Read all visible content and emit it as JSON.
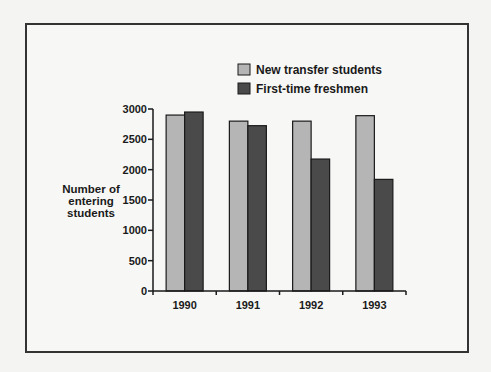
{
  "chart_data": {
    "type": "bar",
    "title": "",
    "categories": [
      "1990",
      "1991",
      "1992",
      "1993"
    ],
    "series": [
      {
        "name": "New transfer students",
        "values": [
          2900,
          2800,
          2800,
          2890
        ],
        "color": "#b5b5b5"
      },
      {
        "name": "First-time freshmen",
        "values": [
          2950,
          2725,
          2175,
          1840
        ],
        "color": "#4a4a4a"
      }
    ],
    "xlabel": "",
    "ylabel": [
      "Number of",
      "entering",
      "students"
    ],
    "ylim": [
      0,
      3000
    ],
    "yticks": [
      0,
      500,
      1000,
      1500,
      2000,
      2500,
      3000
    ],
    "grid": false,
    "legend_position": "top-right"
  }
}
